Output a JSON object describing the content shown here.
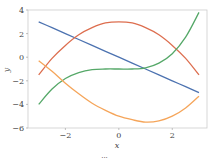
{
  "chart_data": {
    "type": "line",
    "title": "",
    "xlabel": "x",
    "ylabel": "y",
    "xlim": [
      -3.4,
      3.3
    ],
    "ylim": [
      -6,
      4
    ],
    "grid": false,
    "legend": null,
    "xticks": [
      -2,
      0,
      2
    ],
    "xtick_labels": [
      "−2",
      "0",
      "2"
    ],
    "yticks": [
      4,
      2,
      0,
      -2,
      -4,
      -6
    ],
    "ytick_labels": [
      "4",
      "2",
      "0",
      "−2",
      "−4",
      "−6"
    ],
    "x": [
      -3,
      -2.5,
      -2,
      -1.5,
      -1,
      -0.5,
      0,
      0.5,
      1,
      1.5,
      2,
      2.5,
      3
    ],
    "series": [
      {
        "name": "blue",
        "color": "#4c72b0",
        "values": [
          3,
          2.5,
          2,
          1.5,
          1,
          0.5,
          0,
          -0.5,
          -1,
          -1.5,
          -2,
          -2.5,
          -3
        ]
      },
      {
        "name": "red",
        "color": "#dd6e4f",
        "values": [
          -1.5,
          -0.1,
          1.0,
          1.9,
          2.5,
          2.9,
          3.0,
          2.9,
          2.5,
          1.9,
          1.0,
          -0.1,
          -1.5
        ]
      },
      {
        "name": "green",
        "color": "#55a868",
        "values": [
          -4.0,
          -2.7,
          -1.8,
          -1.3,
          -1.05,
          -1.0,
          -1.0,
          -1.0,
          -0.9,
          -0.5,
          0.3,
          1.7,
          3.8
        ]
      },
      {
        "name": "orange",
        "color": "#f5a55a",
        "values": [
          -0.3,
          -1.2,
          -2.2,
          -3.1,
          -3.9,
          -4.5,
          -5.0,
          -5.3,
          -5.5,
          -5.4,
          -5.0,
          -4.3,
          -3.3
        ]
      }
    ]
  },
  "caption": "···"
}
